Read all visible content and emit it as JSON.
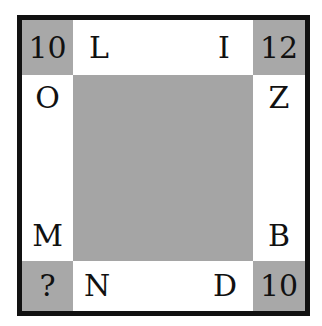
{
  "puzzle": {
    "corners": {
      "top_left": "10",
      "top_right": "12",
      "bottom_left": "?",
      "bottom_right": "10"
    },
    "top_row": [
      "L",
      "I"
    ],
    "bottom_row": [
      "N",
      "D"
    ],
    "left_column": [
      "O",
      "M"
    ],
    "right_column": [
      "Z",
      "B"
    ],
    "colors": {
      "corner_fill": "#a8a8a8",
      "center_fill": "#a5a5a5",
      "border": "#111111"
    }
  }
}
